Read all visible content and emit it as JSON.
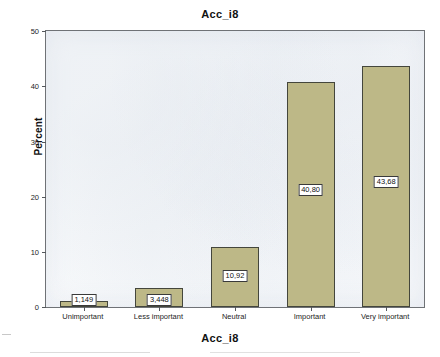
{
  "chart_data": {
    "type": "bar",
    "title": "Acc_i8",
    "xlabel": "Acc_i8",
    "ylabel": "Percent",
    "categories": [
      "Unimportant",
      "Less important",
      "Neutral",
      "Important",
      "Very important"
    ],
    "values": [
      1.149,
      3.448,
      10.92,
      40.8,
      43.68
    ],
    "value_labels": [
      "1,149",
      "3,448",
      "10,92",
      "40,80",
      "43,68"
    ],
    "ylim": [
      0,
      50
    ],
    "yticks": [
      0,
      10,
      20,
      30,
      40,
      50
    ],
    "ytick_labels": [
      "0",
      "10",
      "20",
      "30",
      "40",
      "50"
    ],
    "grid": false,
    "legend": "none",
    "bar_color": "#BDB887",
    "bar_edge_color": "#44463C",
    "plot_background": "#FBFCFD",
    "frame_color": "#6F7276"
  }
}
